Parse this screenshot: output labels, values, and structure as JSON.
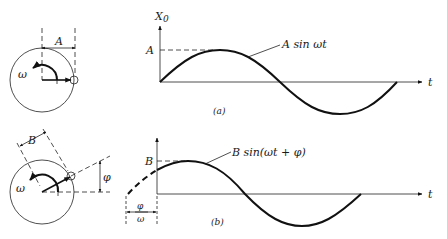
{
  "figure": {
    "panel_a": {
      "caption": "(a)",
      "y_axis_label": "X",
      "y_axis_subscript": "0",
      "t_axis_label": "t",
      "amplitude_label": "A",
      "curve_label": "A sin ωt",
      "phasor_width_label": "A",
      "angular_velocity_label": "ω"
    },
    "panel_b": {
      "caption": "(b)",
      "t_axis_label": "t",
      "amplitude_label": "B",
      "curve_label": "B sin(ωt + φ)",
      "phasor_length_label": "B",
      "phase_angle_label": "φ",
      "angular_velocity_label": "ω",
      "time_shift_numerator": "φ",
      "time_shift_denominator": "ω"
    }
  },
  "colors": {
    "ink": "#1a1a1a",
    "background": "#ffffff"
  }
}
